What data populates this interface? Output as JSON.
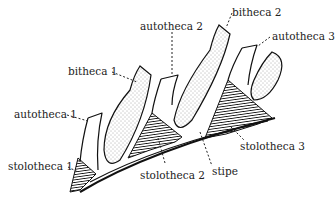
{
  "diagram": {
    "type": "anatomical-line-drawing",
    "labels": {
      "bitheca_1": "bitheca 1",
      "autotheca_2": "autotheca 2",
      "bitheca_2": "bitheca 2",
      "autotheca_3": "autotheca 3",
      "autotheca_1": "autotheca 1",
      "stolotheca_1": "stolotheca 1",
      "stolotheca_2": "stolotheca 2",
      "stipe": "stipe",
      "stolotheca_3": "stolotheca 3"
    },
    "colors": {
      "ink": "#111111",
      "background": "#ffffff"
    }
  }
}
